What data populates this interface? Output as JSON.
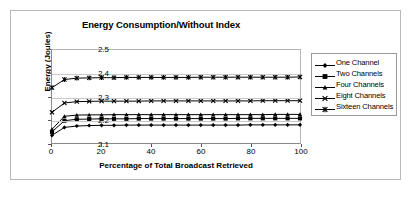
{
  "figure": {
    "title": "Energy Consumption/Without Index"
  },
  "chart_data": {
    "type": "line",
    "title": "Energy Consumption/Without Index",
    "xlabel": "Percentage of Total Broadcast Retrieved",
    "ylabel": "Energy (Joules)",
    "xlim": [
      0,
      100
    ],
    "ylim": [
      2.1,
      2.5
    ],
    "xticks": [
      0,
      20,
      40,
      60,
      80,
      100
    ],
    "yticks": [
      2.1,
      2.2,
      2.3,
      2.4,
      2.5
    ],
    "ytick_labels": [
      "2.1",
      "2.2",
      "2.3",
      "2.4",
      "2.5"
    ],
    "xtick_labels": [
      "0",
      "20",
      "40",
      "60",
      "80",
      "100"
    ],
    "grid": "horizontal",
    "legend_position": "right",
    "x": [
      0,
      5,
      10,
      15,
      20,
      25,
      30,
      35,
      40,
      45,
      50,
      55,
      60,
      65,
      70,
      75,
      80,
      85,
      90,
      95,
      100
    ],
    "series": [
      {
        "name": "One Channel",
        "marker": "diamond",
        "values": [
          2.133,
          2.167,
          2.173,
          2.175,
          2.176,
          2.176,
          2.177,
          2.177,
          2.177,
          2.177,
          2.177,
          2.177,
          2.177,
          2.177,
          2.177,
          2.177,
          2.178,
          2.178,
          2.178,
          2.178,
          2.178
        ]
      },
      {
        "name": "Two Channels",
        "marker": "square",
        "values": [
          2.148,
          2.196,
          2.202,
          2.203,
          2.204,
          2.204,
          2.204,
          2.205,
          2.205,
          2.205,
          2.205,
          2.205,
          2.205,
          2.205,
          2.205,
          2.206,
          2.206,
          2.206,
          2.206,
          2.206,
          2.206
        ]
      },
      {
        "name": "Four Channels",
        "marker": "triangle",
        "values": [
          2.159,
          2.215,
          2.22,
          2.221,
          2.221,
          2.222,
          2.222,
          2.222,
          2.222,
          2.222,
          2.222,
          2.222,
          2.222,
          2.222,
          2.222,
          2.222,
          2.222,
          2.222,
          2.223,
          2.223,
          2.223
        ]
      },
      {
        "name": "Eight Channels",
        "marker": "x",
        "values": [
          2.232,
          2.272,
          2.278,
          2.279,
          2.28,
          2.28,
          2.28,
          2.28,
          2.281,
          2.281,
          2.281,
          2.281,
          2.281,
          2.281,
          2.281,
          2.281,
          2.281,
          2.282,
          2.282,
          2.282,
          2.282
        ]
      },
      {
        "name": "Sixteen Channels",
        "marker": "asterisk",
        "values": [
          2.338,
          2.373,
          2.379,
          2.38,
          2.381,
          2.381,
          2.382,
          2.382,
          2.382,
          2.382,
          2.382,
          2.382,
          2.383,
          2.383,
          2.383,
          2.383,
          2.383,
          2.383,
          2.383,
          2.383,
          2.384
        ]
      }
    ]
  }
}
